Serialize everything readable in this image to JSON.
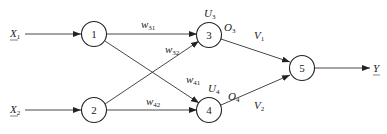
{
  "diagram": {
    "title": "",
    "nodes": [
      {
        "id": "1",
        "label": "1"
      },
      {
        "id": "2",
        "label": "2"
      },
      {
        "id": "3",
        "label": "3",
        "top_label": {
          "main": "U",
          "sub": "3"
        },
        "out_label": {
          "main": "O",
          "sub": "3"
        }
      },
      {
        "id": "4",
        "label": "4",
        "top_label": {
          "main": "U",
          "sub": "4"
        },
        "out_label": {
          "main": "O",
          "sub": "4"
        }
      },
      {
        "id": "5",
        "label": "5"
      }
    ],
    "inputs": [
      {
        "main": "X",
        "sub": "1",
        "to": "1"
      },
      {
        "main": "X",
        "sub": "2",
        "to": "2"
      }
    ],
    "output": {
      "main": "Y",
      "sub": "",
      "from": "5"
    },
    "edges": [
      {
        "from": "1",
        "to": "3",
        "weight": {
          "main": "w",
          "sub": "31"
        }
      },
      {
        "from": "2",
        "to": "3",
        "weight": {
          "main": "w",
          "sub": "32"
        }
      },
      {
        "from": "1",
        "to": "4",
        "weight": {
          "main": "w",
          "sub": "41"
        }
      },
      {
        "from": "2",
        "to": "4",
        "weight": {
          "main": "w",
          "sub": "42"
        }
      },
      {
        "from": "3",
        "to": "5",
        "weight": {
          "main": "V",
          "sub": "1"
        }
      },
      {
        "from": "4",
        "to": "5",
        "weight": {
          "main": "V",
          "sub": "2"
        }
      }
    ]
  }
}
